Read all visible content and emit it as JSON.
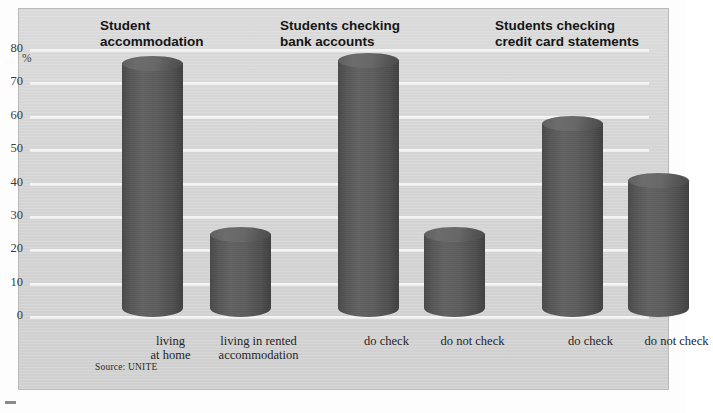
{
  "chart_data": {
    "type": "bar",
    "title": "",
    "xlabel": "",
    "ylabel": "%",
    "ylim": [
      0,
      80
    ],
    "ytick_step": 10,
    "yticks": [
      "80",
      "70",
      "60",
      "50",
      "40",
      "30",
      "20",
      "10",
      "0"
    ],
    "grid": true,
    "legend": "none",
    "source": "Source: UNITE",
    "groups": [
      {
        "title": "Student\naccommodation",
        "categories": [
          "living\nat home",
          "living in rented\naccommodation"
        ],
        "values": [
          76,
          25
        ]
      },
      {
        "title": "Students checking\nbank accounts",
        "categories": [
          "do check",
          "do not check"
        ],
        "values": [
          77,
          25
        ]
      },
      {
        "title": "Students checking\ncredit card statements",
        "categories": [
          "do check",
          "do not check"
        ],
        "values": [
          58,
          41
        ]
      }
    ],
    "categories": [
      "living at home",
      "living in rented accommodation",
      "do check",
      "do not check",
      "do check",
      "do not check"
    ],
    "values": [
      76,
      25,
      77,
      25,
      58,
      41
    ],
    "colors": {
      "bar": "#5a5a5a",
      "bar_highlight": "#6c6c6c",
      "bar_shadow": "#414141",
      "panel_background": "#d6d6d6",
      "gridline": "#f4f4f4",
      "text": "#252525",
      "title_text": "#151515",
      "page_background": "#ffffff",
      "panel_border": "#b9b9b9"
    }
  },
  "axis": {
    "unit_symbol": "%"
  }
}
